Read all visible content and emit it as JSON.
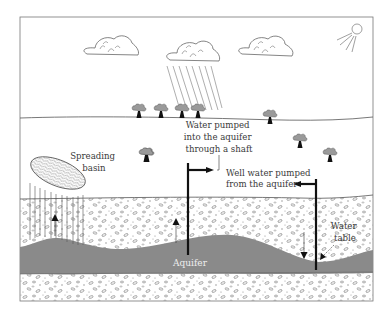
{
  "diagram": {
    "type": "artificial-aquifer-recharge-cross-section",
    "labels": {
      "spreading_basin": [
        "Spreading",
        "basin"
      ],
      "shaft": [
        "Water pumped",
        "into the aquifer",
        "through a shaft"
      ],
      "well": [
        "Well water pumped",
        "from the aquifer"
      ],
      "water_table": [
        "Water",
        "table"
      ],
      "aquifer": "Aquifer"
    },
    "elements": {
      "clouds": 3,
      "rain_cloud_index": 1,
      "trees": 9,
      "sun": true
    },
    "colors": {
      "aquifer": "#8a8a8a",
      "line": "#555555",
      "pipe": "#111111",
      "background": "#ffffff"
    }
  }
}
